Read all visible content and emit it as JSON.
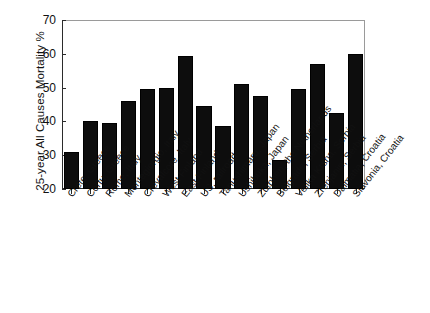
{
  "chart_data": {
    "type": "bar",
    "title": "",
    "xlabel": "",
    "ylabel": "25-year All Causes Mortality %",
    "ylim": [
      20,
      70
    ],
    "yticks": [
      20,
      30,
      40,
      50,
      60,
      70
    ],
    "grid": false,
    "legend": null,
    "bar_color": "#0d0d0d",
    "categories": [
      "Crete, Greece",
      "Corfu, Greece",
      "Rome, Italy",
      "Montegiorgio, Italy",
      "Crevalcore, Italy",
      "West Finland",
      "East Finland",
      "US, railroad",
      "Tanushimaru, Japan",
      "Ushibuka, Japan",
      "Zutphen, the Netherlands",
      "Belgrade, Serbia",
      "Velika Krsna, Serbia",
      "Zrenjanin, Serbia",
      "Dalmatia, Croatia",
      "Slavonia, Croatia"
    ],
    "values": [
      31,
      40,
      39.5,
      46,
      49.5,
      50,
      59.5,
      44.5,
      38.5,
      51,
      47.5,
      28.5,
      49.5,
      57,
      42.5,
      60
    ]
  },
  "axes": {
    "y_title": "25-year All Causes Mortality %",
    "y_tick_labels": [
      "70",
      "60",
      "50",
      "40",
      "30",
      "20"
    ]
  }
}
